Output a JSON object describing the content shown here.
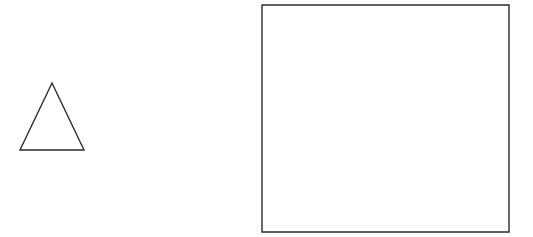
{
  "canvas": {
    "width": 533,
    "height": 237,
    "background_color": "#ffffff",
    "title": "Geometric line drawing"
  },
  "style": {
    "stroke_color": "#2b2b2b",
    "stroke_width": 1.4,
    "fill": "none"
  },
  "shapes": [
    {
      "name": "triangle",
      "type": "polygon",
      "label": "Triangle",
      "fill": "none",
      "stroke_color": "#2b2b2b",
      "stroke_width": 1.4,
      "points": "52,83 84,150 20,150",
      "vertices": [
        {
          "x": 52,
          "y": 83
        },
        {
          "x": 84,
          "y": 150
        },
        {
          "x": 20,
          "y": 150
        }
      ],
      "base_width": 64,
      "height": 67
    },
    {
      "name": "rectangle",
      "type": "rect",
      "label": "Rectangle",
      "fill": "none",
      "stroke_color": "#2b2b2b",
      "stroke_width": 1.4,
      "x": 262,
      "y": 5,
      "width": 247,
      "height": 227
    }
  ]
}
